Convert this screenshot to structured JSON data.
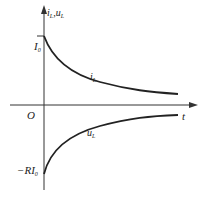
{
  "diagram": {
    "y_axis_label": "i_L , u_L",
    "x_axis_label": "t",
    "origin_label": "O",
    "top_value_label": "I_0",
    "bottom_value_label": "-RI_0",
    "curve_labels": {
      "current": "i_L",
      "voltage": "u_L"
    },
    "stroke_color": "#222222"
  },
  "text": {
    "ylab_i": "i",
    "ylab_sub1": "L",
    "ylab_comma": ",u",
    "ylab_sub2": "L",
    "t": "t",
    "O": "O",
    "I0_main": "I",
    "I0_sub": "0",
    "RI0_main": "−RI",
    "RI0_sub": "0",
    "iL_main": "i",
    "iL_sub": "L",
    "uL_main": "u",
    "uL_sub": "L"
  }
}
